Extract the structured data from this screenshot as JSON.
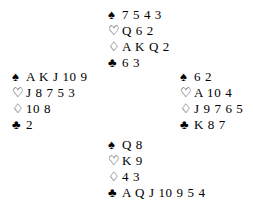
{
  "diagram": {
    "type": "bridge-hand-deal",
    "background_color": "#ffffff",
    "text_color": "#000000",
    "suit_glyphs": {
      "spade": "♠",
      "heart": "♡",
      "diamond": "♢",
      "club": "♣"
    },
    "hands": {
      "north": {
        "position_label": "North",
        "spades": "7 5 4 3",
        "hearts": "Q 6 2",
        "diamonds": "A K Q 2",
        "clubs": "6 3"
      },
      "west": {
        "position_label": "West",
        "spades": "A K J 10 9",
        "hearts": "J 8 7 5 3",
        "diamonds": "10 8",
        "clubs": "2"
      },
      "east": {
        "position_label": "East",
        "spades": "6 2",
        "hearts": "A 10 4",
        "diamonds": "J 9 7 6 5",
        "clubs": "K 8 7"
      },
      "south": {
        "position_label": "South",
        "spades": "Q 8",
        "hearts": "K 9",
        "diamonds": "4 3",
        "clubs": "A Q J 10 9 5 4"
      }
    }
  }
}
